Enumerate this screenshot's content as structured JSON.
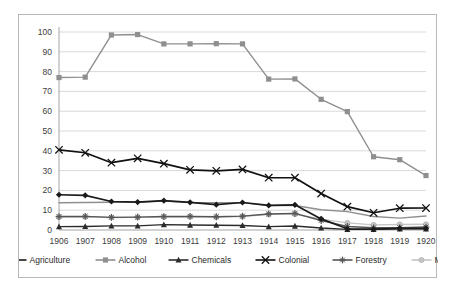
{
  "chart_data": {
    "type": "line",
    "title": "",
    "subtitle": "",
    "xlabel": "",
    "ylabel": "",
    "x": [
      "1906",
      "1907",
      "1908",
      "1909",
      "1910",
      "1911",
      "1912",
      "1913",
      "1914",
      "1915",
      "1916",
      "1917",
      "1918",
      "1919",
      "1920"
    ],
    "categories": [
      "1906",
      "1907",
      "1908",
      "1909",
      "1910",
      "1911",
      "1912",
      "1913",
      "1914",
      "1915",
      "1916",
      "1917",
      "1918",
      "1919",
      "1920"
    ],
    "ylim": [
      0,
      100
    ],
    "yticks": [
      0,
      10,
      20,
      30,
      40,
      50,
      60,
      70,
      80,
      90,
      100
    ],
    "grid": true,
    "legend_position": "bottom",
    "series": [
      {
        "name": "Agriculture",
        "color": "#1a1a1a",
        "marker": "diamond",
        "values": [
          17.8,
          17.5,
          14.4,
          14.1,
          14.8,
          14.0,
          12.8,
          13.9,
          12.4,
          12.7,
          5.6,
          0.6,
          0.4,
          0.8,
          0.8
        ]
      },
      {
        "name": "Alcohol",
        "color": "#8f8f8f",
        "marker": "square",
        "values": [
          77.0,
          77.2,
          98.5,
          98.7,
          94.0,
          94.0,
          94.1,
          94.0,
          76.2,
          76.3,
          66.0,
          59.8,
          37.0,
          35.5,
          27.5
        ]
      },
      {
        "name": "Chemicals",
        "color": "#2b2b2b",
        "marker": "triangle",
        "values": [
          1.7,
          1.8,
          2.1,
          2.1,
          2.7,
          2.5,
          2.4,
          2.3,
          1.7,
          2.0,
          1.0,
          0.3,
          0.3,
          0.6,
          0.6
        ]
      },
      {
        "name": "Colonial",
        "color": "#111111",
        "marker": "x",
        "values": [
          40.5,
          39.0,
          34.0,
          36.2,
          33.5,
          30.4,
          29.9,
          30.6,
          26.4,
          26.4,
          18.4,
          11.8,
          8.7,
          11.0,
          11.1
        ]
      },
      {
        "name": "Forestry",
        "color": "#555555",
        "marker": "star",
        "values": [
          6.8,
          6.9,
          6.4,
          6.5,
          6.8,
          6.9,
          6.7,
          7.0,
          8.1,
          8.4,
          4.8,
          1.8,
          1.1,
          1.2,
          1.5
        ]
      },
      {
        "name": "Metals",
        "color": "#c6c6c6",
        "marker": "circle",
        "values": [
          6.6,
          6.7,
          6.3,
          6.4,
          6.6,
          6.7,
          6.5,
          6.8,
          7.9,
          8.0,
          5.5,
          3.6,
          2.6,
          2.8,
          2.9
        ]
      },
      {
        "name": "Textiles",
        "color": "#8f8f8f",
        "marker": "none",
        "values": [
          13.8,
          13.9,
          14.0,
          14.0,
          14.6,
          13.9,
          13.8,
          13.8,
          12.3,
          12.4,
          10.2,
          9.3,
          6.8,
          6.0,
          7.1
        ]
      }
    ]
  },
  "legend": {
    "items": [
      {
        "label": "Agriculture"
      },
      {
        "label": "Alcohol"
      },
      {
        "label": "Chemicals"
      },
      {
        "label": "Colonial"
      },
      {
        "label": "Forestry"
      },
      {
        "label": "Metals"
      },
      {
        "label": "Textiles"
      }
    ]
  }
}
